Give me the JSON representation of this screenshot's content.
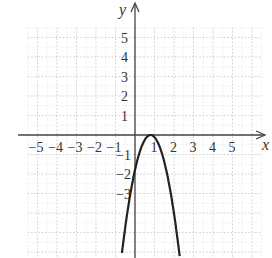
{
  "chart_data": {
    "type": "line",
    "title": "",
    "xlabel": "x",
    "ylabel": "y",
    "xlim": [
      -6,
      6.5
    ],
    "ylim": [
      -6.3,
      6.5
    ],
    "grid": true,
    "x_ticks": [
      -5,
      -4,
      -3,
      -2,
      -1,
      1,
      2,
      3,
      4,
      5
    ],
    "y_ticks": [
      5,
      4,
      3,
      2,
      1,
      -1,
      -2,
      -3
    ],
    "series": [
      {
        "name": "parabola",
        "equation_approx": "y = -2.8(x - 0.8)^2",
        "vertex": [
          0.8,
          0
        ],
        "x": [
          -0.67,
          -0.5,
          0,
          0.5,
          0.8,
          1,
          1.5,
          2,
          2.3
        ],
        "values": [
          -6.05,
          -4.73,
          -1.79,
          -0.25,
          0,
          -0.11,
          -1.37,
          -4.03,
          -6.3
        ]
      }
    ]
  },
  "colors": {
    "axis": "#444444",
    "grid": "#c8c8c8",
    "curve": "#222222"
  }
}
